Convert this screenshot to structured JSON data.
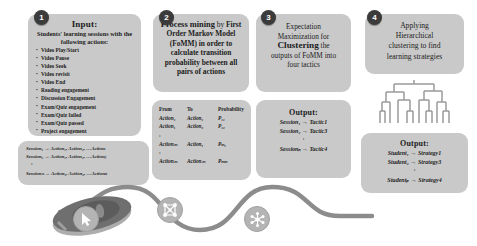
{
  "figure": {
    "background": "#ffffff",
    "box_fill": "#c9c9c9",
    "badge_fill": "#3b3b3b",
    "path_color": "#8c8c8c"
  },
  "step1": {
    "badge": "1",
    "title": "Input:",
    "subtitle": "Students' learning sessions with the following actions:",
    "actions": [
      "Video Play/Start",
      "Video Pause",
      "Video Seek",
      "Video revisit",
      "Video End",
      "Reading engagement",
      "Discussion Engagement",
      "Exam/Quiz engagement",
      "Exam/Quiz failed",
      "Exam/Quiz passed",
      "Project engagement"
    ],
    "sessions": {
      "line1": "Session₁  → Action₁, Action₂, …Actionᵢ",
      "line2": "Session₂  → Action₁, Action₂, …Actionⱼ",
      "ellipsis": ":",
      "line3": "Sessionₙ  → Action₁, Action₂, …Actionₖ"
    }
  },
  "step2": {
    "badge": "2",
    "lead": "Process mining",
    "lead_tail": " by",
    "body": "First Order Markov Model (FoMM) in order to calculate transition probability between all pairs of actions",
    "table": {
      "headers": [
        "From",
        "To",
        "Probability"
      ],
      "rows": [
        [
          "Action₁",
          "Action₁",
          "P₁₁"
        ],
        [
          "Action₁",
          "Action₂",
          "P₁₂"
        ],
        [
          "Actionₘ",
          "Action₁",
          "Pₘ₁"
        ],
        [
          "Actionₘ",
          "Actionₘ",
          "Pₘₘ"
        ]
      ],
      "ellipsis": ":"
    }
  },
  "step3": {
    "badge": "3",
    "line1": "Expectation",
    "line2": "Maximization for",
    "emphasis": "Clustering",
    "line3": " the",
    "line4": "outputs of FoMM into",
    "line5": "four tactics",
    "output": {
      "title": "Output:",
      "rows": [
        {
          "left": "Session₁",
          "arrow": "→",
          "right": "Tactic1"
        },
        {
          "left": "Session₂",
          "arrow": "→",
          "right": "Tactic3"
        }
      ],
      "ellipsis": ":",
      "last": {
        "left": "Sessionₙ",
        "arrow": "→",
        "right": "Tactic4"
      }
    }
  },
  "step4": {
    "badge": "4",
    "line1": "Applying",
    "line2": "Hierarchical",
    "line3": "clustering to find",
    "line4": "learning strategies",
    "dendrogram_label": "dendrogram",
    "output": {
      "title": "Output:",
      "rows": [
        {
          "left": "Student₁",
          "arrow": "→",
          "right": "Strategy1"
        },
        {
          "left": "Student₂",
          "arrow": "→",
          "right": "Strategy3"
        }
      ],
      "ellipsis": ":",
      "last": {
        "left": "Studentₚ",
        "arrow": "→",
        "right": "Strategy4"
      }
    }
  },
  "footer": {
    "icons": [
      "computer-mouse",
      "cursor-pointer-icon",
      "network-nodes-icon",
      "cluster-hub-icon"
    ]
  }
}
